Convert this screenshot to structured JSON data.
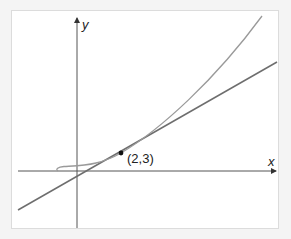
{
  "diagram": {
    "axes": {
      "x_label": "x",
      "y_label": "y"
    },
    "point": {
      "label": "(2,3)",
      "x": 2,
      "y": 3
    },
    "elements": [
      {
        "type": "curve",
        "description": "cubic-like curve passing through (2,3)",
        "color": "#9a9a9a"
      },
      {
        "type": "tangent-line",
        "description": "tangent line at (2,3)",
        "color": "#6e6e6e"
      }
    ],
    "colors": {
      "axis": "#555555",
      "curve": "#9a9a9a",
      "tangent": "#6e6e6e",
      "point": "#111111",
      "frame_border": "#dcdcdc",
      "background": "#ffffff"
    }
  }
}
